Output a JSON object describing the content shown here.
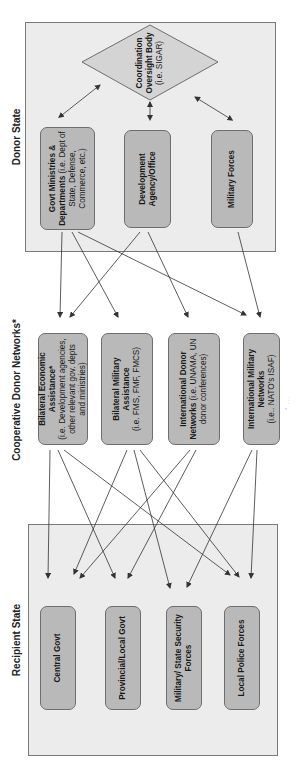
{
  "diagram": {
    "sections": {
      "recipient": {
        "title": "Recipient State"
      },
      "cooperative": {
        "title": "Cooperative Donor Networks*"
      },
      "donor": {
        "title": "Donor State"
      }
    },
    "recipient_nodes": [
      {
        "title": "Central Govt",
        "detail": ""
      },
      {
        "title": "Provincial/Local Govt",
        "detail": ""
      },
      {
        "title": "Military/ State Security Forces",
        "detail": ""
      },
      {
        "title": "Local Police Forces",
        "detail": ""
      }
    ],
    "cooperative_nodes": [
      {
        "title": "Bilateral Economic Assistance*",
        "detail": "(i.e. Development agencies, other relevant gov. depts and ministries)"
      },
      {
        "title": "Bilateral Military Assistance",
        "detail": "(i.e. FMS, FMF, FMCS)"
      },
      {
        "title": "International Donor Networks",
        "detail": "(i.e. UNAMA, UN donor conferences)"
      },
      {
        "title": "International Military Networks",
        "detail": "(i.e.. NATO's ISAF)"
      }
    ],
    "donor_nodes": [
      {
        "title": "Govt Ministries & Departments",
        "detail": "(i.e. Dept of State, Defense, Commerce, etc.)"
      },
      {
        "title": "Development Agency/Office",
        "detail": ""
      },
      {
        "title": "Military Forces",
        "detail": ""
      }
    ],
    "oversight": {
      "title": "Coordination Oversight Body",
      "detail": "(i.e. SIGAR)"
    },
    "colors": {
      "group_fill": "#ececec",
      "node_fill": "#b9b9b9",
      "diamond_fill": "#d4d4d4",
      "border": "#6e6e6e",
      "arrow": "#333333"
    },
    "footnote": "* ..."
  }
}
